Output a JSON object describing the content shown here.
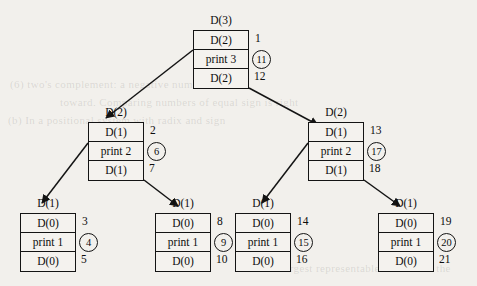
{
  "diagram": {
    "type": "call-tree",
    "ghost_text": [
      "(6) two's complement: a negative number",
      "toward. Comparing numbers of equal sign is right",
      "(b) In a positional system with radix and sign",
      "of the largest representable value with the"
    ],
    "nodes": [
      {
        "id": "root",
        "caption": "D(3)",
        "rows": [
          "D(2)",
          "print 3",
          "D(2)"
        ],
        "steps": [
          "1",
          "11",
          "12"
        ],
        "circled": [
          false,
          true,
          false
        ]
      },
      {
        "id": "mid-left",
        "caption": "D(2)",
        "rows": [
          "D(1)",
          "print 2",
          "D(1)"
        ],
        "steps": [
          "2",
          "6",
          "7"
        ],
        "circled": [
          false,
          true,
          false
        ]
      },
      {
        "id": "mid-right",
        "caption": "D(2)",
        "rows": [
          "D(1)",
          "print 2",
          "D(1)"
        ],
        "steps": [
          "13",
          "17",
          "18"
        ],
        "circled": [
          false,
          true,
          false
        ]
      },
      {
        "id": "leaf-1",
        "caption": "D(1)",
        "rows": [
          "D(0)",
          "print 1",
          "D(0)"
        ],
        "steps": [
          "3",
          "4",
          "5"
        ],
        "circled": [
          false,
          true,
          false
        ]
      },
      {
        "id": "leaf-2",
        "caption": "D(1)",
        "rows": [
          "D(0)",
          "print 1",
          "D(0)"
        ],
        "steps": [
          "8",
          "9",
          "10"
        ],
        "circled": [
          false,
          true,
          false
        ]
      },
      {
        "id": "leaf-3",
        "caption": "D(1)",
        "rows": [
          "D(0)",
          "print 1",
          "D(0)"
        ],
        "steps": [
          "14",
          "15",
          "16"
        ],
        "circled": [
          false,
          true,
          false
        ]
      },
      {
        "id": "leaf-4",
        "caption": "D(1)",
        "rows": [
          "D(0)",
          "print 1",
          "D(0)"
        ],
        "steps": [
          "19",
          "20",
          "21"
        ],
        "circled": [
          false,
          true,
          false
        ]
      }
    ],
    "colors": {
      "ink": "#0d0d0d",
      "paper": "#f2f0ec",
      "rule": "#141414"
    }
  }
}
